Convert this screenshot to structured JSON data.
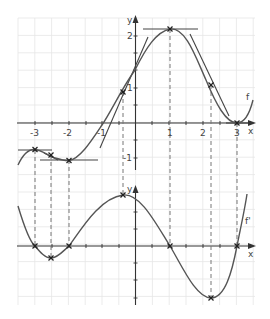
{
  "chart_data": [
    {
      "type": "line",
      "title": "",
      "xlabel": "x",
      "ylabel": "y",
      "xlim": [
        -3.5,
        3.5
      ],
      "ylim": [
        -1.5,
        2.7
      ],
      "grid": true,
      "x_ticks": [
        "-3",
        "-2",
        "-1",
        "1",
        "2",
        "3"
      ],
      "y_ticks": [
        "2",
        "1",
        "-1"
      ],
      "series": [
        {
          "name": "f",
          "points": [
            [
              -3.5,
              -1.2
            ],
            [
              -3,
              -0.8
            ],
            [
              -2.5,
              -0.9
            ],
            [
              -2,
              -1.05
            ],
            [
              -1.5,
              -0.75
            ],
            [
              -1,
              -0.05
            ],
            [
              -0.4,
              0.9
            ],
            [
              0,
              1.4
            ],
            [
              0.5,
              1.95
            ],
            [
              1,
              2.25
            ],
            [
              1.5,
              2.0
            ],
            [
              2,
              1.35
            ],
            [
              2.2,
              1.05
            ],
            [
              2.5,
              0.5
            ],
            [
              3,
              0.0
            ],
            [
              3.4,
              0.55
            ]
          ]
        }
      ],
      "annotations": [
        "horizontal tangent at x=-3",
        "horizontal tangent at x=-2",
        "horizontal tangent at x=1",
        "horizontal tangent at x=3",
        "tangent at inflection x=-0.4",
        "tangent at inflection x=2.2",
        "tangent at inflection x=-2.5"
      ]
    },
    {
      "type": "line",
      "title": "",
      "xlabel": "x",
      "ylabel": "y",
      "xlim": [
        -3.5,
        3.5
      ],
      "grid": true,
      "series": [
        {
          "name": "f'",
          "points": [
            [
              -3.5,
              1.1
            ],
            [
              -3,
              0
            ],
            [
              -2.5,
              -0.35
            ],
            [
              -2,
              0
            ],
            [
              -1.2,
              0.35
            ],
            [
              -0.4,
              0.5
            ],
            [
              0,
              0.4
            ],
            [
              0.5,
              0.15
            ],
            [
              1,
              0
            ],
            [
              1.5,
              -0.35
            ],
            [
              2.2,
              -0.6
            ],
            [
              2.7,
              -0.35
            ],
            [
              3,
              0
            ],
            [
              3.3,
              0.45
            ]
          ]
        }
      ],
      "zeros": [
        -3,
        -2,
        1,
        3
      ],
      "extrema": [
        -2.5,
        -0.4,
        2.2
      ]
    }
  ],
  "labels": {
    "x_axis": "x",
    "y_axis": "y",
    "f": "f",
    "fprime": "f'",
    "xt": [
      "-3",
      "-2",
      "-1",
      "1",
      "2",
      "3"
    ],
    "yt_top": [
      "2",
      "1",
      "-1"
    ]
  }
}
